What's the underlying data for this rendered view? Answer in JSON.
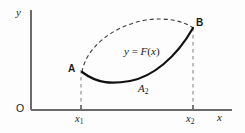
{
  "figure": {
    "kind": "math-diagram",
    "background_color": "#fdfdfd",
    "ink_color": "#1b1b1b",
    "axes": {
      "y_axis_label": "y",
      "x_axis_label": "x",
      "origin_label": "O",
      "x_axis_color": "#6b6b6b",
      "y_axis_color": "#6b6b6b",
      "x_axis_pixel_y": 110,
      "y_axis_pixel_x": 31,
      "x_axis_start_x": 31,
      "x_axis_end_x": 232,
      "y_axis_top_y": 10,
      "grid": false
    },
    "ticks": [
      {
        "name": "x1",
        "label": "x",
        "subscript": "1",
        "pixel_x": 81
      },
      {
        "name": "x2",
        "label": "x",
        "subscript": "2",
        "pixel_x": 193
      }
    ],
    "points": [
      {
        "name": "A",
        "label": "A",
        "pixel_x": 82,
        "pixel_y": 72
      },
      {
        "name": "B",
        "label": "B",
        "pixel_x": 193,
        "pixel_y": 28
      }
    ],
    "curves": [
      {
        "name": "solid-curve",
        "label": "y = F(x)",
        "label_parts": {
          "y": "y",
          "equals": " = ",
          "fn": "F",
          "open": "(",
          "var": "x",
          "close": ")"
        },
        "style": "solid",
        "stroke_width": 2.2,
        "color": "#111111",
        "description": "lower concave-up curve from A dipping to a minimum then rising steeply to B",
        "path": "M 82 72 C 98 84, 112 84, 130 81 C 152 77, 176 58, 193 28"
      },
      {
        "name": "dashed-curve",
        "style": "dashed",
        "stroke_width": 1.1,
        "color": "#3a3a3a",
        "dash_pattern": "4,3",
        "description": "upper concave-down arc from A rising quickly then flattening toward B",
        "path": "M 82 72 C 86 48, 112 26, 146 20 C 166 17, 184 21, 193 28"
      }
    ],
    "dashed_verticals": [
      {
        "name": "vertical-at-x1",
        "pixel_x": 81,
        "from_y": 70,
        "to_y": 110,
        "dash_pattern": "3.5,3.5",
        "color": "#8a8a8a"
      },
      {
        "name": "vertical-at-x2",
        "pixel_x": 193,
        "from_y": 28,
        "to_y": 110,
        "dash_pattern": "3.5,3.5",
        "color": "#8a8a8a"
      }
    ],
    "region_labels": [
      {
        "name": "area-A2",
        "label": "A",
        "subscript": "2"
      }
    ]
  }
}
